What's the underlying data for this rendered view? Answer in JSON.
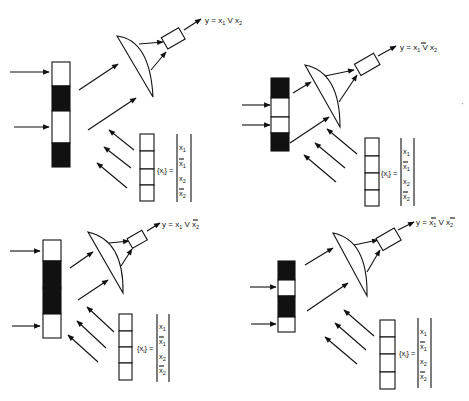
{
  "figure": {
    "colors": {
      "ink": "#111111",
      "background": "#ffffff",
      "mask_dark": "#111111",
      "mask_clear": "#ffffff"
    },
    "panels": [
      {
        "id": "top-left",
        "output_label": {
          "y": "y",
          "eq": "=",
          "a": "x",
          "a_sub": "1",
          "a_bar": false,
          "or": "V",
          "b": "x",
          "b_sub": "2",
          "b_bar": false
        },
        "mask_pattern": [
          "clear",
          "dark",
          "clear",
          "dark"
        ],
        "input_arrows": 2,
        "reference_vector": {
          "symbol": "{x",
          "symbol_sub": "i",
          "symbol_close": "}",
          "eq": "=",
          "entries": [
            {
              "v": "x",
              "sub": "1",
              "bar": false
            },
            {
              "v": "x",
              "sub": "1",
              "bar": true
            },
            {
              "v": "x",
              "sub": "2",
              "bar": false
            },
            {
              "v": "x",
              "sub": "2",
              "bar": true
            }
          ]
        }
      },
      {
        "id": "top-right",
        "output_label": {
          "y": "y",
          "eq": "=",
          "a": "x",
          "a_sub": "1",
          "a_bar": true,
          "or": "V",
          "b": "x",
          "b_sub": "2",
          "b_bar": false
        },
        "mask_pattern": [
          "dark",
          "clear",
          "clear",
          "dark"
        ],
        "input_arrows": 2,
        "reference_vector": {
          "symbol": "{x",
          "symbol_sub": "i",
          "symbol_close": "}",
          "eq": "=",
          "entries": [
            {
              "v": "x",
              "sub": "1",
              "bar": false
            },
            {
              "v": "x",
              "sub": "1",
              "bar": true
            },
            {
              "v": "x",
              "sub": "2",
              "bar": false
            },
            {
              "v": "x",
              "sub": "2",
              "bar": true
            }
          ]
        }
      },
      {
        "id": "bottom-left",
        "output_label": {
          "y": "y",
          "eq": "=",
          "a": "x",
          "a_sub": "1",
          "a_bar": false,
          "or": "V",
          "b": "x",
          "b_sub": "2",
          "b_bar": true
        },
        "mask_pattern": [
          "clear",
          "dark",
          "dark",
          "clear"
        ],
        "input_arrows": 2,
        "reference_vector": {
          "symbol": "{x",
          "symbol_sub": "i",
          "symbol_close": "}",
          "eq": "=",
          "entries": [
            {
              "v": "x",
              "sub": "1",
              "bar": false
            },
            {
              "v": "x",
              "sub": "1",
              "bar": true
            },
            {
              "v": "x",
              "sub": "2",
              "bar": false
            },
            {
              "v": "x",
              "sub": "2",
              "bar": true
            }
          ]
        }
      },
      {
        "id": "bottom-right",
        "output_label": {
          "y": "y",
          "eq": "=",
          "a": "x",
          "a_sub": "1",
          "a_bar": true,
          "or": "V",
          "b": "x",
          "b_sub": "2",
          "b_bar": true
        },
        "mask_pattern": [
          "dark",
          "clear",
          "dark",
          "clear"
        ],
        "input_arrows": 2,
        "reference_vector": {
          "symbol": "{x",
          "symbol_sub": "i",
          "symbol_close": "}",
          "eq": "=",
          "entries": [
            {
              "v": "x",
              "sub": "1",
              "bar": false
            },
            {
              "v": "x",
              "sub": "1",
              "bar": true
            },
            {
              "v": "x",
              "sub": "2",
              "bar": false
            },
            {
              "v": "x",
              "sub": "2",
              "bar": true
            }
          ]
        }
      }
    ]
  }
}
